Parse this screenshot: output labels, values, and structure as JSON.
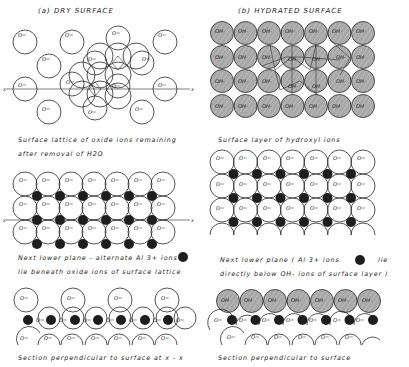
{
  "figure": {
    "panels": [
      {
        "id": "a",
        "title": "(a)  DRY  SURFACE",
        "captions": {
          "top": [
            "Surface  lattice  of  oxide  ions  remaining",
            "after  removal  of  H2O"
          ],
          "middle": [
            "Next  lower  plane - alternate  Al 3+ ions",
            "lie  beneath  oxide  ions  of  surface  lattice"
          ],
          "bottom": "Section  perpendicular  to  surface  at  x - x"
        },
        "axis_label": "x"
      },
      {
        "id": "b",
        "title": "(b)    HYDRATED    SURFACE",
        "captions": {
          "top": "Surface  layer   of  hydroxyl  ions",
          "middle": [
            "Next  lower  plane  ( Al 3+ ions",
            "lie",
            "directly  below   OH-  ions  of  surface  layer )"
          ],
          "bottom": "Section   perpendicular   to   surface"
        }
      }
    ],
    "ion_labels": {
      "oxide": "O=",
      "hydroxyl": "OH-",
      "aluminium": "Al3+"
    },
    "colors": {
      "ink": "#2a2a2a",
      "hydroxyl_fill": "#a9a9a9",
      "aluminium_fill": "#1e1e1e",
      "background": "#ffffff"
    }
  }
}
